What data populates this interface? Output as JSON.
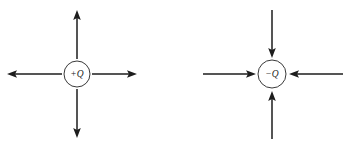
{
  "figure": {
    "background_color": "#ffffff",
    "stroke_color": "#1d1d1d",
    "circle_stroke_color": "#3a3a3a",
    "width": 350,
    "height": 148
  },
  "charges": [
    {
      "id": "positive-charge",
      "label": "+Q",
      "sign": "positive",
      "center_x": 77,
      "center_y": 74,
      "radius": 13,
      "field_direction": "outward",
      "vectors": [
        {
          "name": "vector-up",
          "direction": "up",
          "tip_x": 77,
          "tip_y": 10,
          "tail_x": 77,
          "tail_y": 59
        },
        {
          "name": "vector-down",
          "direction": "down",
          "tip_x": 77,
          "tip_y": 138,
          "tail_x": 77,
          "tail_y": 89
        },
        {
          "name": "vector-left",
          "direction": "left",
          "tip_x": 7,
          "tip_y": 74,
          "tail_x": 62,
          "tail_y": 74
        },
        {
          "name": "vector-right",
          "direction": "right",
          "tip_x": 137,
          "tip_y": 74,
          "tail_x": 92,
          "tail_y": 74
        }
      ]
    },
    {
      "id": "negative-charge",
      "label": "−Q",
      "sign": "negative",
      "center_x": 272,
      "center_y": 74,
      "radius": 14,
      "field_direction": "inward",
      "vectors": [
        {
          "name": "vector-up",
          "direction": "down",
          "tip_x": 272,
          "tip_y": 58,
          "tail_x": 272,
          "tail_y": 10
        },
        {
          "name": "vector-down",
          "direction": "up",
          "tip_x": 272,
          "tip_y": 91,
          "tail_x": 272,
          "tail_y": 139
        },
        {
          "name": "vector-left",
          "direction": "right",
          "tip_x": 256,
          "tip_y": 74,
          "tail_x": 203,
          "tail_y": 74
        },
        {
          "name": "vector-right",
          "direction": "left",
          "tip_x": 289,
          "tip_y": 74,
          "tail_x": 343,
          "tail_y": 74
        }
      ]
    }
  ]
}
